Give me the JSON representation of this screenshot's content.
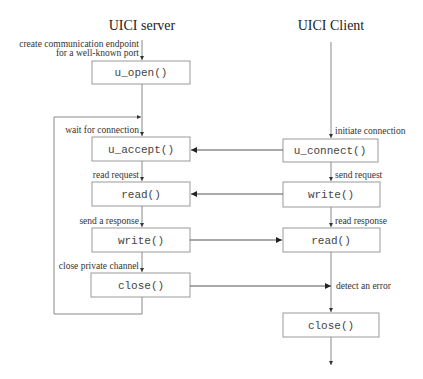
{
  "diagram": {
    "type": "sequence/flow diagram",
    "columns": [
      {
        "id": "server",
        "title": "UICI server"
      },
      {
        "id": "client",
        "title": "UICI Client"
      }
    ],
    "server": {
      "title": "UICI server",
      "steps": [
        {
          "note": "create communication endpoint",
          "note2": "for a well-known port",
          "call": "u_open()"
        },
        {
          "note": "wait for connection",
          "call": "u_accept()"
        },
        {
          "note": "read request",
          "call": "read()"
        },
        {
          "note": "send a response",
          "call": "write()"
        },
        {
          "note": "close private channel",
          "call": "close()"
        }
      ],
      "loop": "close() loops back to u_accept()"
    },
    "client": {
      "title": "UICI Client",
      "steps": [
        {
          "note": "initiate connection",
          "call": "u_connect()"
        },
        {
          "note": "send request",
          "call": "write()"
        },
        {
          "note": "read response",
          "call": "read()"
        },
        {
          "note": "detect an error"
        },
        {
          "call": "close()"
        }
      ]
    },
    "messages": [
      {
        "from": "client.u_connect()",
        "to": "server.u_accept()"
      },
      {
        "from": "client.write()",
        "to": "server.read()"
      },
      {
        "from": "server.write()",
        "to": "client.read()"
      },
      {
        "from": "server.close()",
        "to": "client.detect an error"
      }
    ]
  }
}
